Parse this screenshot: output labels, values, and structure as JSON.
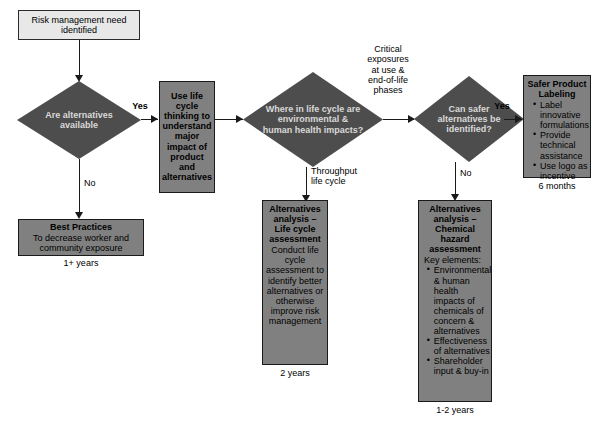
{
  "diagram": {
    "colors": {
      "process_fill": "#808080",
      "start_fill": "#e8e8e8",
      "decision_fill": "#4d4d4d",
      "line": "#1a1a1a",
      "decision_text": "#d9d9d9"
    },
    "start": {
      "label": "Risk management need identified"
    },
    "decisions": [
      {
        "id": "alternatives-available",
        "label": "Are alternatives available"
      },
      {
        "id": "where-in-life-cycle",
        "label": "Where in life cycle are environmental & human health impacts?"
      },
      {
        "id": "safer-alternatives",
        "label": "Can safer alternatives be identified?"
      }
    ],
    "edge_labels": {
      "yes_1": "Yes",
      "no_1": "No",
      "throughput": "Throughput\nlife cycle",
      "critical_exposures": "Critical\nexposures\nat use &\nend-of-life\nphases",
      "yes_2": "Yes",
      "no_2": "No"
    },
    "boxes": {
      "life_cycle_thinking": {
        "id": "use-life-cycle-thinking",
        "title": "Use life cycle thinking to understand major impact of product and alternatives",
        "body": "",
        "bullets": [],
        "duration": ""
      },
      "best_practices": {
        "id": "best-practices",
        "title": "Best Practices",
        "body": "To decrease worker and community exposure",
        "bullets": [],
        "duration": "1+ years"
      },
      "life_cycle_assessment": {
        "id": "alternatives-analysis-life-cycle",
        "title": "Alternatives analysis – Life cycle assessment",
        "body": "Conduct life cycle assessment to identify better alternatives or otherwise improve risk management",
        "bullets": [],
        "duration": "2 years"
      },
      "chemical_hazard": {
        "id": "alternatives-analysis-chemical-hazard",
        "title": "Alternatives analysis – Chemical hazard assessment",
        "body": "Key elements:",
        "bullets": [
          "Environmental & human health impacts of chemicals of concern & alternatives",
          "Effectiveness of alternatives",
          "Shareholder input & buy-in"
        ],
        "duration": "1-2 years"
      },
      "safer_product_labeling": {
        "id": "safer-product-labeling",
        "title": "Safer Product Labeling",
        "body": "",
        "bullets": [
          "Label innovative formulations",
          "Provide technical assistance",
          "Use logo as incentive"
        ],
        "duration": "6 months"
      }
    }
  }
}
